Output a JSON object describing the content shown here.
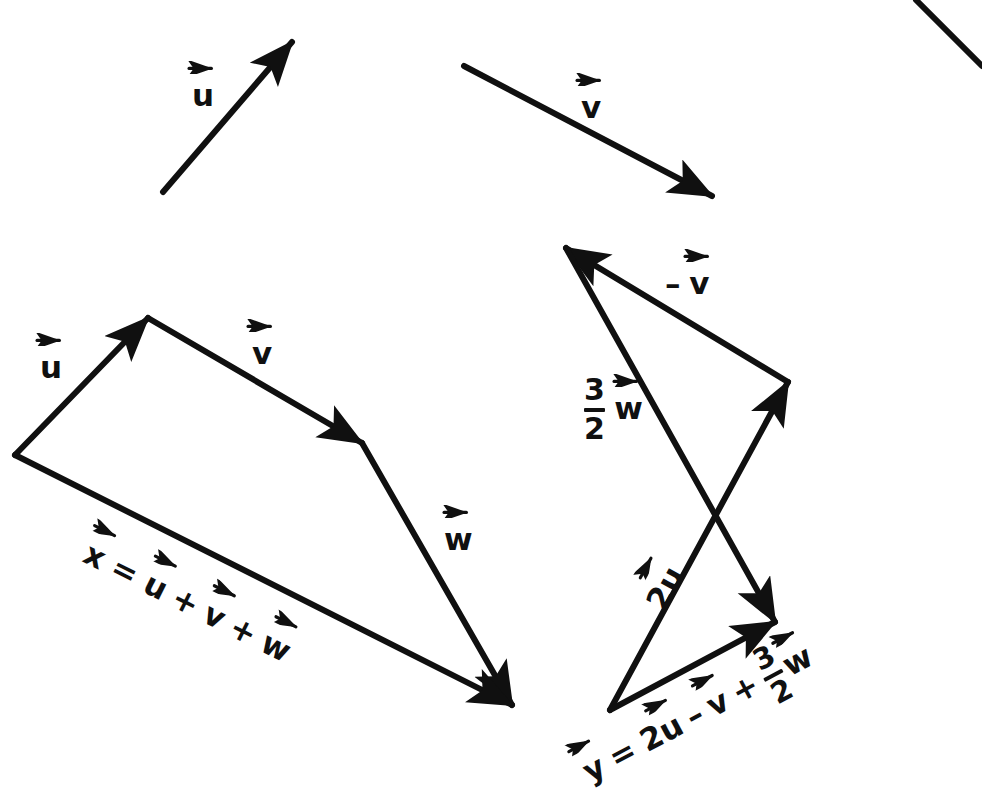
{
  "figure": {
    "background_color": "#ffffff",
    "ink_color": "#101010",
    "width": 982,
    "height": 781
  },
  "given_vectors": {
    "label_u": "u",
    "label_v": "v",
    "u": {
      "name": "u",
      "x1": 163,
      "y1": 192,
      "x2": 292,
      "y2": 42
    },
    "v": {
      "name": "v",
      "x1": 464,
      "y1": 66,
      "x2": 712,
      "y2": 196
    }
  },
  "sum_figure": {
    "name": "x = u + v + w",
    "origin": {
      "x": 15,
      "y": 455
    },
    "legs": [
      {
        "name": "u",
        "label": "u",
        "x1": 15,
        "y1": 455,
        "x2": 148,
        "y2": 318,
        "label_x": 40,
        "label_y": 352
      },
      {
        "name": "v",
        "label": "v",
        "x1": 148,
        "y1": 318,
        "x2": 362,
        "y2": 443,
        "label_x": 252,
        "label_y": 338
      },
      {
        "name": "w",
        "label": "w",
        "x1": 362,
        "y1": 443,
        "x2": 512,
        "y2": 705,
        "label_x": 444,
        "label_y": 524
      }
    ],
    "resultant": {
      "name": "x",
      "x1": 15,
      "y1": 455,
      "x2": 512,
      "y2": 705
    },
    "equation": {
      "lhs": "x",
      "terms": [
        "u",
        "v",
        "w"
      ],
      "operators": [
        "+",
        "+"
      ],
      "equals": "=",
      "anchor_x": 86,
      "anchor_y": 536,
      "angle_deg": 26.7
    }
  },
  "combination_figure": {
    "name": "y = 2u - v + 3/2 w",
    "origin": {
      "x": 610,
      "y": 710
    },
    "legs": [
      {
        "name": "2u",
        "coefficient": "2",
        "label": "u",
        "x1": 610,
        "y1": 710,
        "x2": 788,
        "y2": 382,
        "label_x": 655,
        "label_y": 536,
        "label_angle_deg": -61.5
      },
      {
        "name": "-v",
        "sign": "–",
        "label": "v",
        "x1": 788,
        "y1": 382,
        "x2": 566,
        "y2": 248,
        "label_x": 665,
        "label_y": 268
      },
      {
        "name": "3/2 w",
        "numerator": "3",
        "denominator": "2",
        "label": "w",
        "x1": 566,
        "y1": 248,
        "x2": 775,
        "y2": 622,
        "label_x": 584,
        "label_y": 374
      }
    ],
    "resultant": {
      "name": "y",
      "x1": 610,
      "y1": 710,
      "x2": 775,
      "y2": 622
    },
    "equation": {
      "lhs": "y",
      "equals": "=",
      "term1_coefficient": "2",
      "term1": "u",
      "operator1": "–",
      "term2": "v",
      "operator2": "+",
      "term3_numerator": "3",
      "term3_denominator": "2",
      "term3": "w",
      "anchor_x": 586,
      "anchor_y": 740,
      "angle_deg": -28.0
    }
  },
  "artifacts": {
    "scan_edge": {
      "name": "page-corner-line",
      "x1": 982,
      "y1": 65,
      "x2": 916,
      "y2": 0
    }
  }
}
